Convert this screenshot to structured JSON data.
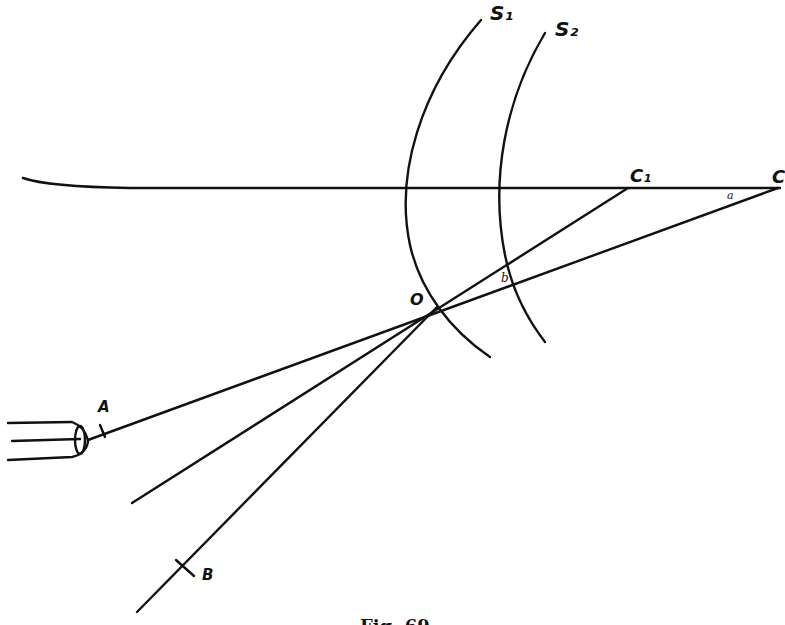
{
  "figure": {
    "caption": "Fig. 69",
    "labels": {
      "surface_1": "S₁",
      "surface_2": "S₂",
      "center_1": "C₁",
      "center_2": "C",
      "point_o": "O",
      "point_a": "A",
      "point_b": "B",
      "angle_a": "a",
      "angle_b": "b"
    },
    "colors": {
      "ink": "#111111",
      "paper": "#ffffff"
    }
  }
}
